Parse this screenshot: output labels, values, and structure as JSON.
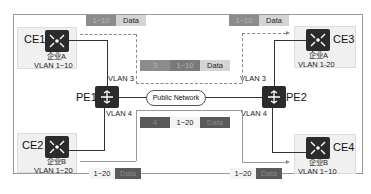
{
  "diagram": {
    "nodes": {
      "ce1": {
        "label": "CE1",
        "org": "企业A",
        "vlan": "VLAN 1~10"
      },
      "ce2": {
        "label": "CE2",
        "org": "企业B",
        "vlan": "VLAN 1~20"
      },
      "ce3": {
        "label": "CE3",
        "org": "企业A",
        "vlan": "VLAN 1-20"
      },
      "ce4": {
        "label": "CE4",
        "org": "企业B",
        "vlan": "VLAN 1~10"
      },
      "pe1": {
        "label": "PE1"
      },
      "pe2": {
        "label": "PE2"
      }
    },
    "links": {
      "pe1_up": "VLAN 3",
      "pe1_down": "VLAN 4",
      "pe2_up": "VLAN 3",
      "pe2_down": "VLAN 4",
      "cloud": "Public Network"
    },
    "packets": {
      "top_left": {
        "vlan": "1~10",
        "payload": "Data"
      },
      "top_right": {
        "vlan": "1~10",
        "payload": "Data"
      },
      "middle_top": {
        "outer": "3",
        "vlan": "1~10",
        "payload": "Data"
      },
      "middle_bottom": {
        "outer": "4",
        "vlan": "1~20",
        "payload": "Data"
      },
      "bottom_left": {
        "vlan": "1~20",
        "payload": "Data"
      },
      "bottom_right": {
        "vlan": "1~20",
        "payload": "Data"
      }
    }
  }
}
